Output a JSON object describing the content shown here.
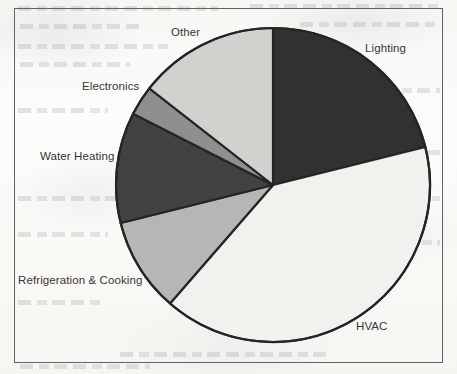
{
  "figure": {
    "background_color": "#fbfaf8",
    "frame_color": "#5a5a5a",
    "label_color": "#2b2b2b"
  },
  "chart_data": {
    "type": "pie",
    "title": "",
    "subtitle": "",
    "xlabel": "",
    "ylabel": "",
    "legend_position": "none",
    "grid": false,
    "label_placement": "outside",
    "start_angle_deg_from_12oclock": 0,
    "direction": "clockwise",
    "center_px": [
      273,
      185
    ],
    "radius_px": 157,
    "categories": [
      "Lighting",
      "HVAC",
      "Refrigeration & Cooking",
      "Water Heating",
      "Electronics",
      "Other"
    ],
    "values": [
      21,
      40,
      10,
      11,
      3,
      15
    ],
    "unit": "percent",
    "slices": [
      {
        "label": "Lighting",
        "value": 21,
        "angle_deg": 76,
        "start_deg": 0,
        "end_deg": 76,
        "color": "#262626"
      },
      {
        "label": "HVAC",
        "value": 40,
        "angle_deg": 145,
        "start_deg": 76,
        "end_deg": 221,
        "color": "#f2f1ee"
      },
      {
        "label": "Refrigeration & Cooking",
        "value": 10,
        "angle_deg": 35,
        "start_deg": 221,
        "end_deg": 256,
        "color": "#b3b3b3"
      },
      {
        "label": "Water Heating",
        "value": 11,
        "angle_deg": 41,
        "start_deg": 256,
        "end_deg": 297,
        "color": "#383838"
      },
      {
        "label": "Electronics",
        "value": 3,
        "angle_deg": 11,
        "start_deg": 297,
        "end_deg": 308,
        "color": "#8a8a8a"
      },
      {
        "label": "Other",
        "value": 15,
        "angle_deg": 52,
        "start_deg": 308,
        "end_deg": 360,
        "color": "#cfcfcb"
      }
    ]
  },
  "labels": {
    "other": "Other",
    "lighting": "Lighting",
    "electronics": "Electronics",
    "water_heating": "Water Heating",
    "refrigeration_cooking": "Refrigeration & Cooking",
    "hvac": "HVAC"
  }
}
